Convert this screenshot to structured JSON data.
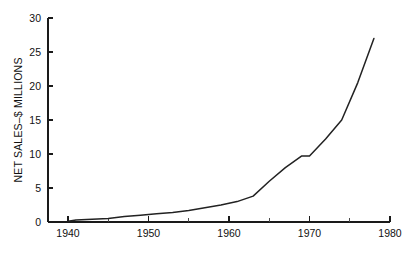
{
  "chart_data": {
    "type": "line",
    "title": "",
    "xlabel": "",
    "ylabel": "NET SALES–$ MILLIONS",
    "xlim": [
      1937,
      1980
    ],
    "ylim": [
      0,
      30
    ],
    "grid": false,
    "legend": false,
    "x_ticks": [
      1940,
      1950,
      1960,
      1970,
      1980
    ],
    "x_tick_labels": [
      "1940",
      "1950",
      "1960",
      "1970",
      "1980"
    ],
    "x_minor_ticks": [
      1945,
      1955,
      1965,
      1975
    ],
    "y_ticks": [
      0,
      5,
      10,
      15,
      20,
      25,
      30
    ],
    "y_tick_labels": [
      "0",
      "5",
      "10",
      "15",
      "20",
      "25",
      "30"
    ],
    "series": [
      {
        "name": "Net Sales",
        "color": "#222222",
        "x": [
          1940,
          1941,
          1943,
          1945,
          1947,
          1949,
          1950,
          1951,
          1953,
          1955,
          1957,
          1959,
          1961,
          1963,
          1965,
          1967,
          1969,
          1970,
          1972,
          1974,
          1976,
          1978
        ],
        "values": [
          0.1,
          0.3,
          0.4,
          0.5,
          0.8,
          1.0,
          1.1,
          1.2,
          1.4,
          1.7,
          2.1,
          2.5,
          3.0,
          3.8,
          6.0,
          8.0,
          9.7,
          9.7,
          12.2,
          15.0,
          20.5,
          27.0
        ]
      }
    ]
  },
  "axis": {
    "y_title": "NET SALES–$ MILLIONS"
  }
}
